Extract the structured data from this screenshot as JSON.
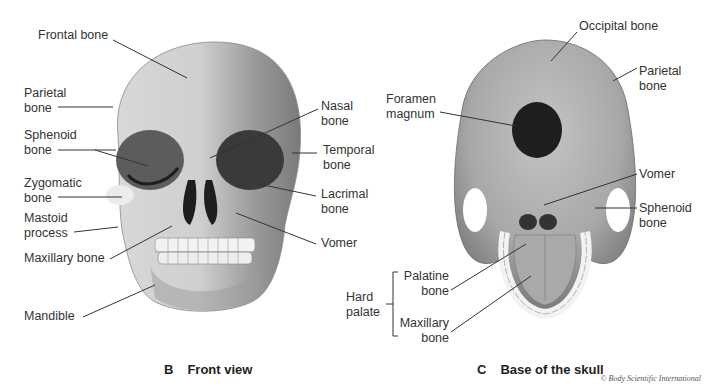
{
  "figures": [
    {
      "letter": "B",
      "title": "Front view",
      "labels": {
        "frontal": "Frontal bone",
        "parietal": "Parietal\nbone",
        "sphenoid": "Sphenoid\nbone",
        "zygomatic": "Zygomatic\nbone",
        "mastoid": "Mastoid\nprocess",
        "maxillary": "Maxillary bone",
        "mandible": "Mandible",
        "nasal": "Nasal\nbone",
        "temporal": "Temporal\nbone",
        "lacrimal": "Lacrimal\nbone",
        "vomer": "Vomer"
      }
    },
    {
      "letter": "C",
      "title": "Base of the skull",
      "labels": {
        "occipital": "Occipital bone",
        "parietal": "Parietal\nbone",
        "foramen": "Foramen\nmagnum",
        "vomer": "Vomer",
        "sphenoid": "Sphenoid\nbone",
        "hard_palate": "Hard\npalate",
        "palatine": "Palatine\nbone",
        "maxillary": "Maxillary\nbone"
      }
    }
  ],
  "credit": "© Body Scientific International",
  "colors": {
    "bone_light": "#e6e6e6",
    "bone_mid": "#b8b8b8",
    "bone_dark": "#6a6a6a",
    "cavity": "#1e1e1e",
    "leader_line": "#333333"
  }
}
